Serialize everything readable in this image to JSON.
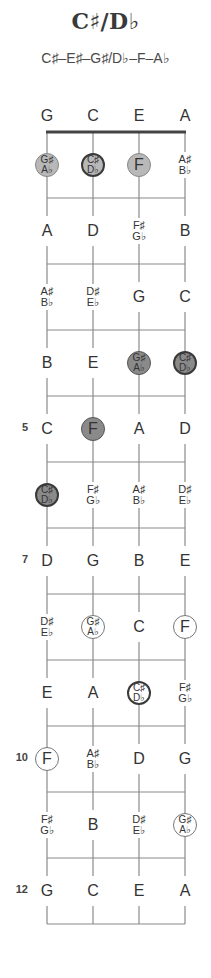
{
  "title": "C♯/D♭",
  "subtitle": "C♯–E♯–G♯/D♭–F–A♭",
  "strings": [
    "G",
    "C",
    "E",
    "A"
  ],
  "fret_numbers": [
    {
      "fret": 5,
      "label": "5"
    },
    {
      "fret": 7,
      "label": "7"
    },
    {
      "fret": 10,
      "label": "10"
    },
    {
      "fret": 12,
      "label": "12"
    }
  ],
  "frets": [
    [
      {
        "n": [
          "G♯",
          "A♭"
        ],
        "style": "light"
      },
      {
        "n": [
          "C♯",
          "D♭"
        ],
        "style": "light",
        "root": true
      },
      {
        "n": [
          "F"
        ],
        "style": "light"
      },
      {
        "n": [
          "A♯",
          "B♭"
        ]
      }
    ],
    [
      {
        "n": [
          "A"
        ]
      },
      {
        "n": [
          "D"
        ]
      },
      {
        "n": [
          "F♯",
          "G♭"
        ]
      },
      {
        "n": [
          "B"
        ]
      }
    ],
    [
      {
        "n": [
          "A♯",
          "B♭"
        ]
      },
      {
        "n": [
          "D♯",
          "E♭"
        ]
      },
      {
        "n": [
          "G"
        ]
      },
      {
        "n": [
          "C"
        ]
      }
    ],
    [
      {
        "n": [
          "B"
        ]
      },
      {
        "n": [
          "E"
        ]
      },
      {
        "n": [
          "G♯",
          "A♭"
        ],
        "style": "dark"
      },
      {
        "n": [
          "C♯",
          "D♭"
        ],
        "style": "dark",
        "root": true
      }
    ],
    [
      {
        "n": [
          "C"
        ]
      },
      {
        "n": [
          "F"
        ],
        "style": "dark"
      },
      {
        "n": [
          "A"
        ]
      },
      {
        "n": [
          "D"
        ]
      }
    ],
    [
      {
        "n": [
          "C♯",
          "D♭"
        ],
        "style": "dark",
        "root": true
      },
      {
        "n": [
          "F♯",
          "G♭"
        ]
      },
      {
        "n": [
          "A♯",
          "B♭"
        ]
      },
      {
        "n": [
          "D♯",
          "E♭"
        ]
      }
    ],
    [
      {
        "n": [
          "D"
        ]
      },
      {
        "n": [
          "G"
        ]
      },
      {
        "n": [
          "B"
        ]
      },
      {
        "n": [
          "E"
        ]
      }
    ],
    [
      {
        "n": [
          "D♯",
          "E♭"
        ]
      },
      {
        "n": [
          "G♯",
          "A♭"
        ],
        "style": "outline"
      },
      {
        "n": [
          "C"
        ]
      },
      {
        "n": [
          "F"
        ],
        "style": "outline"
      }
    ],
    [
      {
        "n": [
          "E"
        ]
      },
      {
        "n": [
          "A"
        ]
      },
      {
        "n": [
          "C♯",
          "D♭"
        ],
        "style": "outline",
        "root": true
      },
      {
        "n": [
          "F♯",
          "G♭"
        ]
      }
    ],
    [
      {
        "n": [
          "F"
        ],
        "style": "outline"
      },
      {
        "n": [
          "A♯",
          "B♭"
        ]
      },
      {
        "n": [
          "D"
        ]
      },
      {
        "n": [
          "G"
        ]
      }
    ],
    [
      {
        "n": [
          "F♯",
          "G♭"
        ]
      },
      {
        "n": [
          "B"
        ]
      },
      {
        "n": [
          "D♯",
          "E♭"
        ]
      },
      {
        "n": [
          "G♯",
          "A♭"
        ],
        "style": "outline"
      }
    ],
    [
      {
        "n": [
          "G"
        ]
      },
      {
        "n": [
          "C"
        ]
      },
      {
        "n": [
          "E"
        ]
      },
      {
        "n": [
          "A"
        ]
      }
    ]
  ],
  "colors": {
    "line": "#8a8a8a",
    "nut": "#444444",
    "light_fill": "#b8b8b8",
    "dark_fill": "#8a8a8a"
  }
}
